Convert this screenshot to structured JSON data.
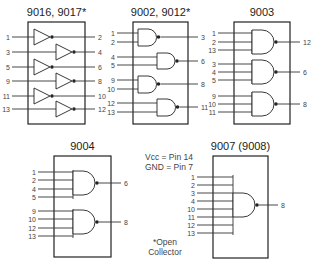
{
  "chips": [
    {
      "id": "9016",
      "title": "9016, 9017*",
      "type": "hex-inverter",
      "box": {
        "x": 28,
        "y": 22,
        "w": 57,
        "h": 102
      },
      "gates": [
        {
          "inputs": [
            {
              "pin": "1",
              "y": 37
            }
          ],
          "output": {
            "pin": "2",
            "y": 37
          },
          "pos": "left"
        },
        {
          "inputs": [
            {
              "pin": "3",
              "y": 52
            }
          ],
          "output": {
            "pin": "4",
            "y": 52
          },
          "pos": "right"
        },
        {
          "inputs": [
            {
              "pin": "5",
              "y": 67
            }
          ],
          "output": {
            "pin": "6",
            "y": 67
          },
          "pos": "left"
        },
        {
          "inputs": [
            {
              "pin": "9",
              "y": 81
            }
          ],
          "output": {
            "pin": "8",
            "y": 81
          },
          "pos": "right"
        },
        {
          "inputs": [
            {
              "pin": "11",
              "y": 96
            }
          ],
          "output": {
            "pin": "10",
            "y": 96
          },
          "pos": "left"
        },
        {
          "inputs": [
            {
              "pin": "13",
              "y": 109
            }
          ],
          "output": {
            "pin": "12",
            "y": 109
          },
          "pos": "right"
        }
      ]
    },
    {
      "id": "9002",
      "title": "9002, 9012*",
      "type": "quad-2-input-nand",
      "box": {
        "x": 133,
        "y": 22,
        "w": 55,
        "h": 102
      },
      "gates": [
        {
          "inputs": [
            {
              "pin": "1",
              "y": 33
            },
            {
              "pin": "2",
              "y": 42
            }
          ],
          "output": {
            "pin": "3",
            "y": 37
          },
          "pos": "left"
        },
        {
          "inputs": [
            {
              "pin": "4",
              "y": 57
            },
            {
              "pin": "5",
              "y": 65
            }
          ],
          "output": {
            "pin": "6",
            "y": 61
          },
          "pos": "right"
        },
        {
          "inputs": [
            {
              "pin": "9",
              "y": 80
            },
            {
              "pin": "10",
              "y": 89
            }
          ],
          "output": {
            "pin": "8",
            "y": 84
          },
          "pos": "left"
        },
        {
          "inputs": [
            {
              "pin": "12",
              "y": 103
            },
            {
              "pin": "13",
              "y": 112
            }
          ],
          "output": {
            "pin": "11",
            "y": 107
          },
          "pos": "right"
        }
      ]
    },
    {
      "id": "9003",
      "title": "9003",
      "type": "triple-3-input-nand",
      "box": {
        "x": 234,
        "y": 22,
        "w": 56,
        "h": 102
      },
      "gates": [
        {
          "inputs": [
            {
              "pin": "1",
              "y": 33
            },
            {
              "pin": "2",
              "y": 42
            },
            {
              "pin": "13",
              "y": 50
            }
          ],
          "output": {
            "pin": "12",
            "y": 42
          }
        },
        {
          "inputs": [
            {
              "pin": "3",
              "y": 64
            },
            {
              "pin": "4",
              "y": 72
            },
            {
              "pin": "5",
              "y": 80
            }
          ],
          "output": {
            "pin": "6",
            "y": 72
          }
        },
        {
          "inputs": [
            {
              "pin": "9",
              "y": 96
            },
            {
              "pin": "10",
              "y": 104
            },
            {
              "pin": "11",
              "y": 112
            }
          ],
          "output": {
            "pin": "8",
            "y": 104
          }
        }
      ]
    },
    {
      "id": "9004",
      "title": "9004",
      "type": "dual-4-input-nand",
      "box": {
        "x": 54,
        "y": 156,
        "w": 57,
        "h": 101
      },
      "gates": [
        {
          "inputs": [
            {
              "pin": "1",
              "y": 172
            },
            {
              "pin": "2",
              "y": 180
            },
            {
              "pin": "4",
              "y": 189
            },
            {
              "pin": "5",
              "y": 197
            }
          ],
          "output": {
            "pin": "6",
            "y": 183
          }
        },
        {
          "inputs": [
            {
              "pin": "9",
              "y": 211
            },
            {
              "pin": "10",
              "y": 219
            },
            {
              "pin": "12",
              "y": 228
            },
            {
              "pin": "13",
              "y": 236
            }
          ],
          "output": {
            "pin": "8",
            "y": 222
          }
        }
      ]
    },
    {
      "id": "9007",
      "title": "9007 (9008)",
      "type": "8-input-nand",
      "box": {
        "x": 213,
        "y": 156,
        "w": 55,
        "h": 102
      },
      "gates": [
        {
          "inputs": [
            {
              "pin": "1",
              "y": 177
            },
            {
              "pin": "2",
              "y": 185
            },
            {
              "pin": "3",
              "y": 193
            },
            {
              "pin": "4",
              "y": 201
            },
            {
              "pin": "10",
              "y": 209
            },
            {
              "pin": "11",
              "y": 217
            },
            {
              "pin": "12",
              "y": 225
            },
            {
              "pin": "13",
              "y": 233
            }
          ],
          "output": {
            "pin": "8",
            "y": 205
          }
        }
      ]
    }
  ],
  "notes": {
    "vcc": "Vcc = Pin 14",
    "gnd": "GND = Pin  7",
    "open_collector_line1": "*Open",
    "open_collector_line2": "Collector"
  }
}
